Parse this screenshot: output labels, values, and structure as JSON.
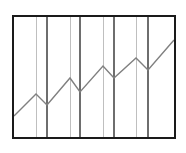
{
  "chart_data": {
    "type": "line",
    "title": "",
    "subtitle": "",
    "xlabel": "",
    "ylabel": "",
    "grid": "vertical-only",
    "legend_position": "none",
    "axis_ticks_visible": false,
    "tick_labels": [],
    "legend_entries": [],
    "annotations": [],
    "xlim": [
      0,
      18
    ],
    "ylim": [
      0,
      10
    ],
    "x": [
      0,
      2,
      3,
      5,
      6,
      8,
      9,
      11,
      12,
      14.5
    ],
    "y": [
      1.2,
      3.0,
      2.1,
      4.3,
      3.1,
      5.3,
      4.3,
      6.5,
      5.5,
      8.0
    ],
    "series": [
      {
        "name": "series-1",
        "x": [
          0,
          2,
          3,
          5,
          6,
          8,
          9,
          11,
          12,
          14.5
        ],
        "values": [
          1.2,
          3.0,
          2.1,
          4.3,
          3.1,
          5.3,
          4.3,
          6.5,
          5.5,
          8.0
        ]
      }
    ],
    "gridline_x_values": [
      2,
      3,
      5,
      6,
      8,
      9,
      11,
      12
    ]
  },
  "chart": {
    "frame": {
      "x": 13,
      "y": 16,
      "width": 162,
      "height": 122,
      "stroke": "#1a1a1a",
      "stroke_width": 2,
      "fill": "#ffffff"
    },
    "line": {
      "stroke": "#808080",
      "stroke_width": 1.4,
      "points": "14,116 36,94 47,105 70,78 80,92 103,66 114,78 136,58 148,70 174,40"
    },
    "gridlines": [
      {
        "name": "gridline-1",
        "x": 36,
        "stroke": "#bfbfbf",
        "stroke_width": 1
      },
      {
        "name": "gridline-2",
        "x": 47,
        "stroke": "#6e6e6e",
        "stroke_width": 1.2
      },
      {
        "name": "gridline-3",
        "x": 70,
        "stroke": "#bfbfbf",
        "stroke_width": 1
      },
      {
        "name": "gridline-4",
        "x": 80,
        "stroke": "#6e6e6e",
        "stroke_width": 1.2
      },
      {
        "name": "gridline-5",
        "x": 103,
        "stroke": "#bfbfbf",
        "stroke_width": 1
      },
      {
        "name": "gridline-6",
        "x": 114,
        "stroke": "#6e6e6e",
        "stroke_width": 1.2
      },
      {
        "name": "gridline-7",
        "x": 136,
        "stroke": "#bfbfbf",
        "stroke_width": 1
      },
      {
        "name": "gridline-8",
        "x": 148,
        "stroke": "#6e6e6e",
        "stroke_width": 1.2
      }
    ]
  },
  "colors": {
    "frame_stroke": "#1a1a1a",
    "line_stroke": "#808080",
    "gridline_light": "#bfbfbf",
    "gridline_dark": "#6e6e6e",
    "background": "#ffffff"
  }
}
